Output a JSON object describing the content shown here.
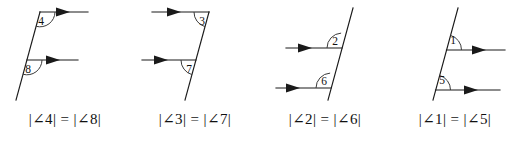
{
  "figure": {
    "width": 520,
    "height": 145,
    "background": "#ffffff",
    "ink_color": "#1a1a1a"
  },
  "panels": [
    {
      "id": "panel-angle-4-8",
      "angle_top": "4",
      "angle_bottom": "8",
      "caption": "|∠4| = |∠8|",
      "transversal": "upper-right to lower-left",
      "ray_direction": "right",
      "ray_arrowheads": 2
    },
    {
      "id": "panel-angle-3-7",
      "angle_top": "3",
      "angle_bottom": "7",
      "caption": "|∠3| = |∠7|",
      "transversal": "upper-right to lower-left",
      "ray_direction": "right",
      "ray_arrowheads": 2
    },
    {
      "id": "panel-angle-2-6",
      "angle_top": "2",
      "angle_bottom": "6",
      "caption": "|∠2| = |∠6|",
      "transversal": "upper-right to lower-left",
      "ray_direction": "right",
      "ray_arrowheads": 2
    },
    {
      "id": "panel-angle-1-5",
      "angle_top": "1",
      "angle_bottom": "5",
      "caption": "|∠1| = |∠5|",
      "transversal": "upper-right to lower-left",
      "ray_direction": "right",
      "ray_arrowheads": 2
    }
  ]
}
